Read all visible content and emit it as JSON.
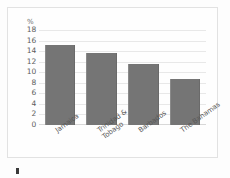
{
  "chart_data": {
    "type": "bar",
    "title": "",
    "subtitle": "",
    "xlabel": "",
    "ylabel": "%",
    "categories": [
      "Jamaica",
      "Trinidad & Tobago",
      "Barbados",
      "The Bahamas"
    ],
    "category_lines": [
      [
        "Jamaica"
      ],
      [
        "Trinidad &",
        "Tobago"
      ],
      [
        "Barbados"
      ],
      [
        "The Bahamas"
      ]
    ],
    "values": [
      15.2,
      13.7,
      11.6,
      8.7
    ],
    "ylim": [
      0,
      18
    ],
    "ytick_step": 2,
    "yticks": [
      "18",
      "16",
      "14",
      "12",
      "10",
      "8",
      "6",
      "4",
      "2",
      "0"
    ],
    "grid": true,
    "legend": "none",
    "bar_color": "#757575",
    "gridline_color": "#e8e8e8",
    "axis_label_color": "#5c5c5c",
    "background_color": "#fefefe"
  },
  "axis": {
    "unit_symbol": "%"
  }
}
